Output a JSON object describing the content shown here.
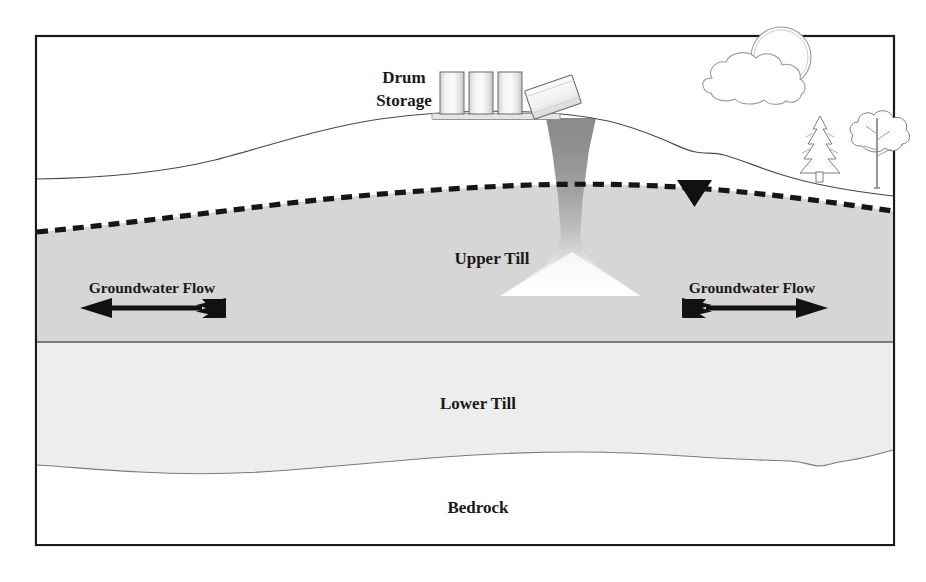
{
  "figure": {
    "frame_color": "#1a1a1a",
    "background_color": "#ffffff"
  },
  "labels": {
    "source_line1": "Drum",
    "source_line2": "Storage",
    "upper_till": "Upper Till",
    "lower_till": "Lower Till",
    "bedrock": "Bedrock",
    "groundwater_flow_left": "Groundwater Flow",
    "groundwater_flow_right": "Groundwater Flow"
  },
  "strata": [
    {
      "name": "upper-till",
      "label": "Upper Till",
      "fill_unsaturated": "#ffffff",
      "fill_saturated": "#d6d6d6",
      "top_boundary": "ground-surface",
      "bottom_boundary": "upper-lower-till-contact"
    },
    {
      "name": "lower-till",
      "label": "Lower Till",
      "fill": "#ededed",
      "top_boundary": "upper-lower-till-contact",
      "bottom_boundary": "bedrock-contact"
    },
    {
      "name": "bedrock",
      "label": "Bedrock",
      "fill": "#ffffff",
      "top_boundary": "bedrock-contact"
    }
  ],
  "water_table": {
    "style": "dashed",
    "color": "#1a1a1a",
    "marker": "inverted-solid-triangle",
    "marker_label": ""
  },
  "plume": {
    "name": "contaminant-plume",
    "color_top": "#8c8c8c",
    "color_mid": "#b8b8b8",
    "color_bottom": "#ffffff",
    "shape": "funnel-narrowing-then-spreading"
  },
  "drums": {
    "upright_count": 3,
    "tipped_count": 1,
    "fill": "#f4f4f4",
    "stroke": "#5a5a5a",
    "pad_fill": "#e8e8e8"
  },
  "sky": {
    "sun": "sun-icon",
    "cloud": "cloud-icon"
  },
  "vegetation": [
    {
      "name": "conifer-tree",
      "type": "pine"
    },
    {
      "name": "deciduous-tree",
      "type": "broadleaf"
    }
  ],
  "arrows": {
    "left": {
      "direction": "left",
      "style": "fletched",
      "color": "#111111"
    },
    "right": {
      "direction": "right",
      "style": "fletched",
      "color": "#111111"
    }
  }
}
